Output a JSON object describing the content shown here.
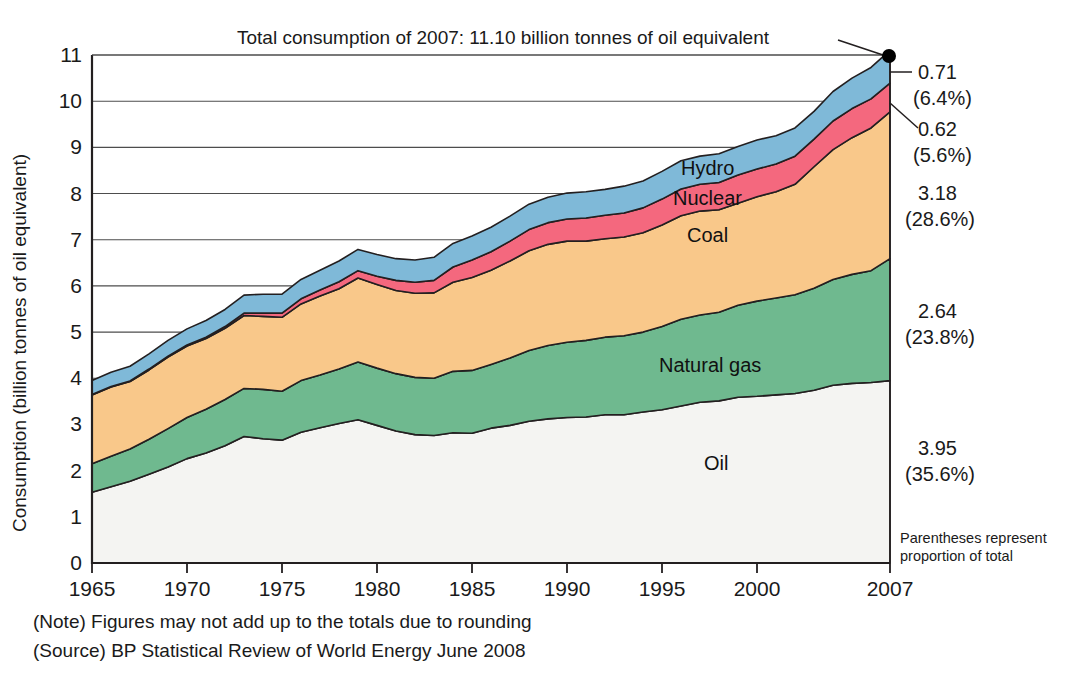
{
  "chart_data": {
    "type": "area",
    "stacked": true,
    "title": "Total consumption of 2007: 11.10 billion tonnes of oil equivalent",
    "xlabel": "",
    "ylabel": "Consumption (billion tonnes of oil equivalent)",
    "ylim": [
      0,
      11
    ],
    "xlim": [
      1965,
      2007
    ],
    "grid": true,
    "legend_position": "inline-labels",
    "ytick_labels": [
      "0",
      "1",
      "2",
      "3",
      "4",
      "5",
      "6",
      "7",
      "8",
      "9",
      "10",
      "11"
    ],
    "xtick_labels": [
      "1965",
      "1970",
      "1975",
      "1980",
      "1985",
      "1990",
      "1995",
      "2000",
      "2007"
    ],
    "xticks": [
      1965,
      1970,
      1975,
      1980,
      1985,
      1990,
      1995,
      2000,
      2007
    ],
    "x": [
      1965,
      1966,
      1967,
      1968,
      1969,
      1970,
      1971,
      1972,
      1973,
      1974,
      1975,
      1976,
      1977,
      1978,
      1979,
      1980,
      1981,
      1982,
      1983,
      1984,
      1985,
      1986,
      1987,
      1988,
      1989,
      1990,
      1991,
      1992,
      1993,
      1994,
      1995,
      1996,
      1997,
      1998,
      1999,
      2000,
      2001,
      2002,
      2003,
      2004,
      2005,
      2006,
      2007
    ],
    "series": [
      {
        "name": "Oil",
        "color": "#f4f4f2",
        "label_2007": "3.95",
        "percent_2007": "(35.6%)",
        "values": [
          1.53,
          1.65,
          1.77,
          1.92,
          2.08,
          2.26,
          2.38,
          2.54,
          2.74,
          2.69,
          2.66,
          2.83,
          2.93,
          3.02,
          3.1,
          2.98,
          2.86,
          2.78,
          2.76,
          2.82,
          2.81,
          2.92,
          2.98,
          3.07,
          3.12,
          3.15,
          3.16,
          3.21,
          3.21,
          3.27,
          3.32,
          3.4,
          3.48,
          3.51,
          3.59,
          3.61,
          3.64,
          3.67,
          3.74,
          3.85,
          3.89,
          3.91,
          3.95
        ]
      },
      {
        "name": "Natural gas",
        "color": "#6fb98f",
        "label_2007": "2.64",
        "percent_2007": "(23.8%)",
        "values": [
          0.62,
          0.66,
          0.7,
          0.76,
          0.83,
          0.89,
          0.95,
          1.0,
          1.04,
          1.07,
          1.06,
          1.12,
          1.14,
          1.18,
          1.25,
          1.24,
          1.24,
          1.24,
          1.24,
          1.33,
          1.36,
          1.38,
          1.46,
          1.53,
          1.59,
          1.63,
          1.66,
          1.68,
          1.71,
          1.73,
          1.8,
          1.88,
          1.89,
          1.92,
          1.99,
          2.06,
          2.1,
          2.14,
          2.21,
          2.29,
          2.36,
          2.42,
          2.64
        ]
      },
      {
        "name": "Coal",
        "color": "#f9c88a",
        "label_2007": "3.18",
        "percent_2007": "(28.6%)",
        "values": [
          1.49,
          1.5,
          1.46,
          1.5,
          1.55,
          1.55,
          1.53,
          1.54,
          1.58,
          1.58,
          1.6,
          1.66,
          1.71,
          1.74,
          1.82,
          1.81,
          1.8,
          1.82,
          1.85,
          1.93,
          2.01,
          2.04,
          2.1,
          2.16,
          2.19,
          2.19,
          2.15,
          2.13,
          2.14,
          2.15,
          2.2,
          2.24,
          2.25,
          2.22,
          2.21,
          2.26,
          2.3,
          2.39,
          2.63,
          2.81,
          2.96,
          3.09,
          3.18
        ]
      },
      {
        "name": "Nuclear",
        "color": "#f4687e",
        "label_2007": "0.62",
        "percent_2007": "(5.6%)",
        "values": [
          0.01,
          0.01,
          0.01,
          0.02,
          0.02,
          0.02,
          0.03,
          0.04,
          0.05,
          0.07,
          0.09,
          0.11,
          0.13,
          0.15,
          0.16,
          0.18,
          0.22,
          0.24,
          0.27,
          0.33,
          0.38,
          0.4,
          0.43,
          0.46,
          0.47,
          0.48,
          0.5,
          0.51,
          0.52,
          0.54,
          0.56,
          0.58,
          0.58,
          0.59,
          0.61,
          0.6,
          0.6,
          0.61,
          0.6,
          0.62,
          0.63,
          0.63,
          0.62
        ]
      },
      {
        "name": "Hydro",
        "color": "#7fb9d8",
        "label_2007": "0.71",
        "percent_2007": "(6.4%)",
        "values": [
          0.3,
          0.31,
          0.32,
          0.33,
          0.34,
          0.35,
          0.36,
          0.37,
          0.39,
          0.41,
          0.41,
          0.42,
          0.43,
          0.45,
          0.46,
          0.47,
          0.47,
          0.48,
          0.5,
          0.51,
          0.52,
          0.53,
          0.54,
          0.55,
          0.55,
          0.56,
          0.57,
          0.56,
          0.58,
          0.58,
          0.6,
          0.61,
          0.61,
          0.62,
          0.62,
          0.63,
          0.61,
          0.61,
          0.6,
          0.64,
          0.66,
          0.68,
          0.71
        ]
      }
    ],
    "total_2007": "11.10",
    "annotations": {
      "parentheses_note_line1": "Parentheses represent",
      "parentheses_note_line2": "proportion of total",
      "note": "(Note) Figures may not add up to the totals due to rounding",
      "source": "(Source) BP Statistical Review of World Energy June 2008"
    }
  },
  "colors": {
    "oil": "#f4f4f2",
    "natural_gas": "#6fb98f",
    "coal": "#f9c88a",
    "nuclear": "#f4687e",
    "hydro": "#7fb9d8",
    "axis": "#231f20",
    "grid": "#555555"
  }
}
